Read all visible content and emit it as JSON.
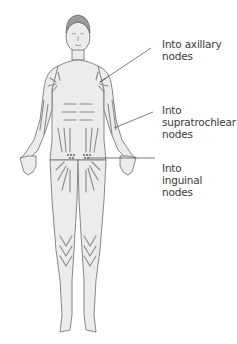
{
  "labels": {
    "axillary": {
      "line1": "Into axillary",
      "line2": "nodes"
    },
    "supratrochlear": {
      "line1": "Into",
      "line2": "supratrochlear",
      "line3": "nodes"
    },
    "inguinal": {
      "line1": "Into",
      "line2": "inguinal",
      "line3": "nodes"
    }
  },
  "colors": {
    "skin": "#ececec",
    "outline": "#6a6a6a",
    "arrow": "#8a8a8a",
    "leader": "#444444",
    "text": "#3a3a3a"
  }
}
